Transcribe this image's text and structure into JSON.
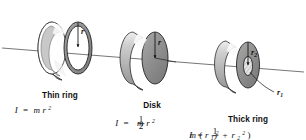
{
  "figure": {
    "background_color": "#ffffff",
    "axis": {
      "name": "rotation-axis",
      "color": "#5a5a5a",
      "x1": 2,
      "y1": 48,
      "x2": 304,
      "y2": 72
    },
    "palette": {
      "face_dark": "#8c8c8c",
      "face_mid": "#9c9c9c",
      "rim_light": "#c9c9c9",
      "rim_highlight": "#f2f2f2",
      "hole_light": "#e2e2e2",
      "outline": "#1a1a1a",
      "text": "#111111"
    },
    "objects": [
      {
        "id": "thin-ring",
        "label": "Thin ring",
        "formula_plain": "I = mr²",
        "formula": {
          "symbol": "I",
          "equals": "=",
          "mass": "m",
          "radius": "r",
          "exponent": "2"
        },
        "radius_labels": [
          {
            "name": "radius-r",
            "text": "r",
            "sub": ""
          }
        ],
        "center_x": 78,
        "center_y": 46,
        "label_x": 60,
        "label_y": 98,
        "formula_x": 60,
        "formula_y": 113
      },
      {
        "id": "disk",
        "label": "Disk",
        "formula_plain": "I = ½mr²",
        "formula": {
          "symbol": "I",
          "equals": "=",
          "numerator": "1",
          "denominator": "2",
          "mass": "m",
          "radius": "r",
          "exponent": "2"
        },
        "radius_labels": [
          {
            "name": "radius-r",
            "text": "r",
            "sub": ""
          }
        ],
        "center_x": 155,
        "center_y": 56,
        "label_x": 152,
        "label_y": 108,
        "formula_x": 152,
        "formula_y": 124
      },
      {
        "id": "thick-ring",
        "label": "Thick ring",
        "formula_plain": "I = ½m(r₁² + r₂²)",
        "formula": {
          "symbol": "I",
          "equals": "=",
          "numerator": "1",
          "denominator": "2",
          "mass": "m",
          "open": "(",
          "radius_inner": "r",
          "sub_inner": "1",
          "exp_inner": "2",
          "plus": "+",
          "radius_outer": "r",
          "sub_outer": "2",
          "exp_outer": "2",
          "close": ")"
        },
        "radius_labels": [
          {
            "name": "radius-r2",
            "text": "r",
            "sub": "2"
          },
          {
            "name": "radius-r1",
            "text": "r",
            "sub": "1"
          }
        ],
        "center_x": 246,
        "center_y": 63,
        "label_x": 248,
        "label_y": 122,
        "formula_x": 248,
        "formula_y": 137
      }
    ]
  }
}
